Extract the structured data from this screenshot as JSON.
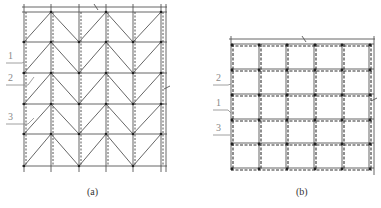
{
  "figure_a": {
    "caption": "(a)",
    "labels": [
      "1",
      "2",
      "3"
    ],
    "pattern": "zigzag-braced-grid",
    "columns": 6,
    "rows": 5
  },
  "figure_b": {
    "caption": "(b)",
    "labels": [
      "2",
      "1",
      "3"
    ],
    "pattern": "square-grid",
    "columns": 6,
    "rows": 5
  },
  "colors": {
    "line": "#555555",
    "dash": "#444444",
    "node": "#222222",
    "label": "#888888"
  }
}
